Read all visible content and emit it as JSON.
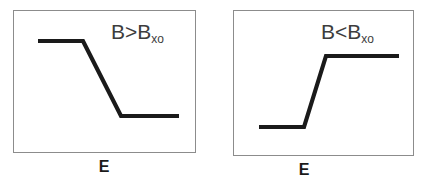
{
  "figure": {
    "background_color": "#ffffff",
    "panel_border_color": "#8c8c8c",
    "curve_color": "#1a1a1a",
    "label_color": "#3d3d3d",
    "axis_label_color": "#1a1a1a"
  },
  "panels": [
    {
      "id": "left",
      "condition": {
        "base": "B>B",
        "subscript": "xo",
        "full": "B>Bxo"
      },
      "axis_label": "E",
      "curve": {
        "shape": "step-down",
        "description": "high plateau, descending ramp, low plateau",
        "points": [
          {
            "x": 24,
            "y": 30
          },
          {
            "x": 69,
            "y": 30
          },
          {
            "x": 107,
            "y": 105
          },
          {
            "x": 165,
            "y": 105
          }
        ]
      }
    },
    {
      "id": "right",
      "condition": {
        "base": "B<B",
        "subscript": "xo",
        "full": "B<Bxo"
      },
      "axis_label": "E",
      "curve": {
        "shape": "step-up",
        "description": "low plateau, ascending ramp, high plateau",
        "points": [
          {
            "x": 25,
            "y": 116
          },
          {
            "x": 70,
            "y": 116
          },
          {
            "x": 92,
            "y": 45
          },
          {
            "x": 165,
            "y": 45
          }
        ]
      }
    }
  ],
  "chart_data": {
    "type": "line",
    "title": "",
    "xlabel": "E",
    "ylabel": "",
    "grid": false,
    "legend_position": "none",
    "panels": [
      {
        "name": "B>Bxo",
        "annotation": "B>Bxo",
        "xlabel": "E",
        "x": [
          0.06,
          0.31,
          0.51,
          0.83
        ],
        "y": [
          0.79,
          0.79,
          0.27,
          0.27
        ],
        "series_name": "transmission-decreasing"
      },
      {
        "name": "B<Bxo",
        "annotation": "B<Bxo",
        "xlabel": "E",
        "x": [
          0.07,
          0.39,
          0.51,
          0.91
        ],
        "y": [
          0.21,
          0.21,
          0.69,
          0.69
        ],
        "series_name": "transmission-increasing"
      }
    ]
  }
}
